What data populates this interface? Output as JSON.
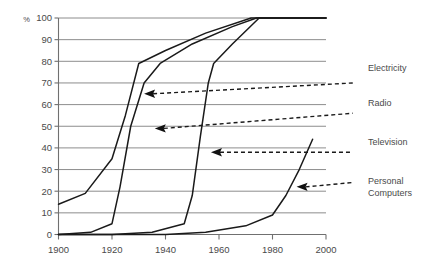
{
  "chart_data": {
    "type": "line",
    "title": "",
    "subtitle": "",
    "xlabel": "",
    "ylabel": "%",
    "xlim": [
      1900,
      2000
    ],
    "ylim": [
      0,
      100
    ],
    "grid": true,
    "legend_position": "right-annotations",
    "x_ticks": [
      "1900",
      "1920",
      "1940",
      "1960",
      "1980",
      "2000"
    ],
    "x_tick_values": [
      1900,
      1920,
      1940,
      1960,
      1980,
      2000
    ],
    "y_ticks": [
      "0",
      "10",
      "20",
      "30",
      "40",
      "50",
      "60",
      "70",
      "80",
      "90",
      "100"
    ],
    "y_tick_values": [
      0,
      10,
      20,
      30,
      40,
      50,
      60,
      70,
      80,
      90,
      100
    ],
    "y_unit_symbol": "%",
    "series": [
      {
        "name": "Electricity",
        "points": [
          [
            1900,
            14
          ],
          [
            1910,
            19
          ],
          [
            1920,
            35
          ],
          [
            1925,
            55
          ],
          [
            1930,
            79
          ],
          [
            1940,
            85
          ],
          [
            1955,
            93
          ],
          [
            1972,
            100
          ],
          [
            2000,
            100
          ]
        ]
      },
      {
        "name": "Radio",
        "points": [
          [
            1900,
            0
          ],
          [
            1912,
            1
          ],
          [
            1920,
            5
          ],
          [
            1923,
            22
          ],
          [
            1927,
            50
          ],
          [
            1932,
            70
          ],
          [
            1938,
            79
          ],
          [
            1950,
            88
          ],
          [
            1965,
            96
          ],
          [
            1974,
            100
          ],
          [
            2000,
            100
          ]
        ]
      },
      {
        "name": "Television",
        "points": [
          [
            1900,
            0
          ],
          [
            1920,
            0
          ],
          [
            1935,
            1
          ],
          [
            1947,
            5
          ],
          [
            1950,
            18
          ],
          [
            1953,
            45
          ],
          [
            1956,
            70
          ],
          [
            1958,
            79
          ],
          [
            1965,
            88
          ],
          [
            1975,
            100
          ],
          [
            2000,
            100
          ]
        ]
      },
      {
        "name": "Personal Computers",
        "points": [
          [
            1900,
            0
          ],
          [
            1940,
            0
          ],
          [
            1955,
            1
          ],
          [
            1970,
            4
          ],
          [
            1980,
            9
          ],
          [
            1985,
            18
          ],
          [
            1990,
            30
          ],
          [
            1995,
            44
          ]
        ]
      }
    ],
    "annotations": [
      {
        "label": "Electricity",
        "arrow_at": [
          1932,
          65
        ],
        "label_at": [
          2010,
          70
        ]
      },
      {
        "label": "Radio",
        "arrow_at": [
          1936,
          49
        ],
        "label_at": [
          2010,
          56
        ]
      },
      {
        "label": "Television",
        "arrow_at": [
          1957,
          38
        ],
        "label_at": [
          2010,
          38
        ]
      },
      {
        "label": "Personal Computers",
        "arrow_at": [
          1989,
          22
        ],
        "label_at": [
          2010,
          24
        ]
      }
    ]
  },
  "legend": {
    "items": [
      {
        "label": "Electricity"
      },
      {
        "label": "Radio"
      },
      {
        "label": "Television"
      },
      {
        "label": "Personal"
      },
      {
        "label": "Computers"
      }
    ]
  },
  "colors": {
    "background": "#ffffff",
    "grid": "#808080",
    "axis": "#707070",
    "series": "#1a1a1a",
    "text": "#4a4a4a"
  }
}
